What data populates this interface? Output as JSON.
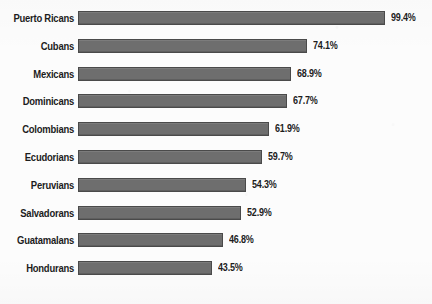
{
  "chart_data": {
    "type": "bar",
    "orientation": "horizontal",
    "title": "",
    "subtitle": "",
    "xlabel": "",
    "ylabel": "",
    "categories": [
      "Puerto Ricans",
      "Cubans",
      "Mexicans",
      "Dominicans",
      "Colombians",
      "Ecudorians",
      "Peruvians",
      "Salvadorans",
      "Guatamalans",
      "Hondurans"
    ],
    "values": [
      99.4,
      74.1,
      68.9,
      67.7,
      61.9,
      59.7,
      54.3,
      52.9,
      46.8,
      43.5
    ],
    "value_labels": [
      "99.4%",
      "74.1%",
      "68.9%",
      "67.7%",
      "61.9%",
      "59.7%",
      "54.3%",
      "52.9%",
      "46.8%",
      "43.5%"
    ],
    "xlim": [
      0,
      99.4
    ],
    "grid": false,
    "legend": false,
    "legend_position": "none",
    "bar_color": "#6e6e6e",
    "bar_border_color": "#4a4a4a",
    "text_color": "#1d1d1d",
    "background_color": "#fcfcfc"
  },
  "layout": {
    "bar_origin_x_px": 78,
    "px_per_unit": 3.09,
    "row_pitch_px": 27.8,
    "first_row_top_px": 7,
    "bar_height_px": 14,
    "value_gap_px": 6
  }
}
